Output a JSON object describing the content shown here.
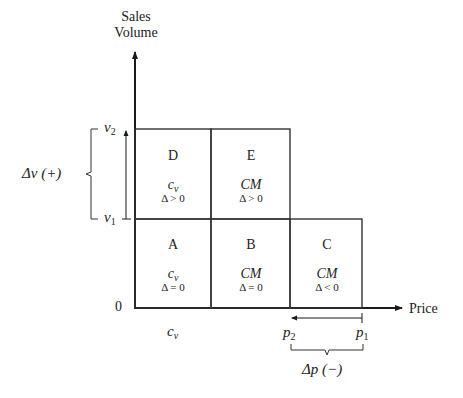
{
  "axes": {
    "y_title_line1": "Sales",
    "y_title_line2": "Volume",
    "x_title": "Price",
    "origin": "0"
  },
  "y_ticks": {
    "v2": {
      "base": "v",
      "sub": "2"
    },
    "v1": {
      "base": "v",
      "sub": "1"
    }
  },
  "x_ticks": {
    "cv": {
      "base": "c",
      "sub": "v"
    },
    "p2": {
      "base": "p",
      "sub": "2"
    },
    "p1": {
      "base": "p",
      "sub": "1"
    }
  },
  "annotations": {
    "delta_v": "Δv (+)",
    "delta_p": "Δp (−)"
  },
  "cells": [
    {
      "id": "D",
      "letter": "D",
      "var": "c",
      "var_sub": "v",
      "delta": "Δ > 0"
    },
    {
      "id": "E",
      "letter": "E",
      "var": "CM",
      "var_sub": "",
      "delta": "Δ > 0"
    },
    {
      "id": "A",
      "letter": "A",
      "var": "c",
      "var_sub": "v",
      "delta": "Δ = 0"
    },
    {
      "id": "B",
      "letter": "B",
      "var": "CM",
      "var_sub": "",
      "delta": "Δ = 0"
    },
    {
      "id": "C",
      "letter": "C",
      "var": "CM",
      "var_sub": "",
      "delta": "Δ < 0"
    }
  ],
  "colors": {
    "line": "#1a1a1a",
    "text": "#222222",
    "background": "#ffffff"
  }
}
